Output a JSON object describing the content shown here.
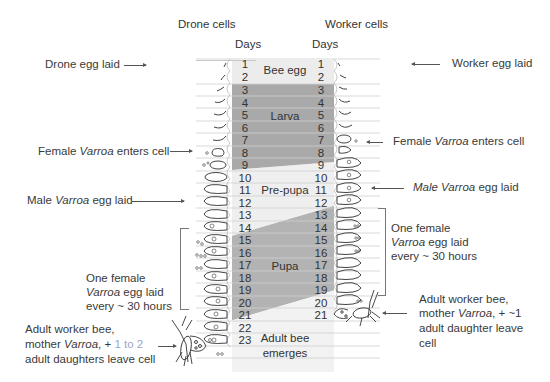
{
  "headers": {
    "drone_cells": "Drone cells",
    "worker_cells": "Worker cells",
    "drone_days": "Days",
    "worker_days": "Days"
  },
  "drone_days": [
    "1",
    "2",
    "3",
    "4",
    "5",
    "6",
    "7",
    "8",
    "9",
    "10",
    "11",
    "12",
    "13",
    "14",
    "15",
    "16",
    "17",
    "18",
    "19",
    "20",
    "21",
    "22",
    "23"
  ],
  "worker_days": [
    "1",
    "2",
    "3",
    "4",
    "5",
    "6",
    "7",
    "8",
    "9",
    "10",
    "11",
    "12",
    "13",
    "14",
    "15",
    "16",
    "17",
    "18",
    "19",
    "20",
    "21"
  ],
  "stages": {
    "egg": "Bee egg",
    "larva": "Larva",
    "prepupa": "Pre-pupa",
    "pupa": "Pupa",
    "adult_line1": "Adult bee",
    "adult_line2": "emerges"
  },
  "left_annotations": {
    "drone_egg": "Drone egg laid",
    "female_enters_pre": "Female ",
    "female_enters_italic": "Varroa",
    "female_enters_post": " enters cell",
    "male_egg_italic": "Male ",
    "male_egg_italic2": "Varroa",
    "male_egg_post": " egg laid",
    "one_female_1": "One female",
    "one_female_2_italic": "Varroa",
    "one_female_2_post": " egg laid",
    "one_female_3": "every ~ 30 hours",
    "adult_1": "Adult worker bee,",
    "adult_2_pre": "mother ",
    "adult_2_italic": "Varroa",
    "adult_2_post": ", + ",
    "adult_2_highlight": "1 to 2",
    "adult_3": "adult daughters leave cell"
  },
  "right_annotations": {
    "worker_egg": "Worker egg laid",
    "female_enters_pre": "Female ",
    "female_enters_italic": "Varroa",
    "female_enters_post": " enters cell",
    "male_egg_italic": "Male Varroa",
    "male_egg_post": " egg laid",
    "one_female_1": "One female",
    "one_female_2_italic": "Varroa",
    "one_female_2_post": " egg laid",
    "one_female_3": "every ~ 30 hours",
    "adult_1": "Adult worker bee,",
    "adult_2_pre": "mother ",
    "adult_2_italic": "Varroa",
    "adult_2_post": ", + ~1",
    "adult_3": "adult daughter leave",
    "adult_4": "cell"
  },
  "colors": {
    "egg_bg": "#ececec",
    "larva_bg": "#a9a9a9",
    "prepupa_bg": "#efefef",
    "pupa_bg": "#b3b3b3",
    "adult_bg": "#f2f2f2",
    "highlight_text": "#9aa6c8"
  }
}
